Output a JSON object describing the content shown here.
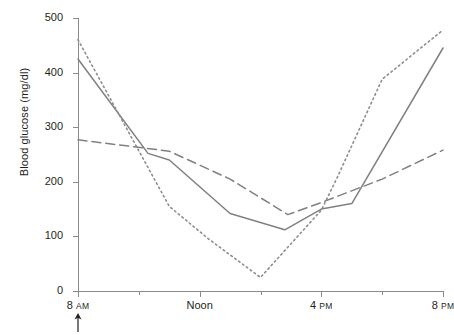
{
  "chart_data": {
    "type": "line",
    "title": "",
    "xlabel": "",
    "ylabel": "Blood glucose (mg/dl)",
    "ylim": [
      0,
      500
    ],
    "yticks": [
      0,
      100,
      200,
      300,
      400,
      500
    ],
    "ytick_labels": [
      "0",
      "100",
      "200",
      "300",
      "400",
      "500"
    ],
    "xlim": [
      "8 AM",
      "8 PM"
    ],
    "xticks_hours": [
      8,
      10,
      12,
      14,
      16,
      18,
      20
    ],
    "xtick_labels": [
      {
        "hour": 8,
        "text": "8",
        "suffix": "AM",
        "major": true
      },
      {
        "hour": 10,
        "text": "",
        "suffix": "",
        "major": false
      },
      {
        "hour": 12,
        "text": "Noon",
        "suffix": "",
        "major": true
      },
      {
        "hour": 14,
        "text": "",
        "suffix": "",
        "major": false
      },
      {
        "hour": 16,
        "text": "4",
        "suffix": "PM",
        "major": true
      },
      {
        "hour": 18,
        "text": "",
        "suffix": "",
        "major": false
      },
      {
        "hour": 20,
        "text": "8",
        "suffix": "PM",
        "major": true
      }
    ],
    "grid": false,
    "legend": "none",
    "annotations": [
      {
        "name": "dose-arrow",
        "symbol": "↑",
        "at_hour": 8,
        "below_axis": true
      }
    ],
    "series": [
      {
        "name": "solid",
        "style": "solid",
        "color": "#808080",
        "points": [
          {
            "hour": 8,
            "value": 425
          },
          {
            "hour": 10.3,
            "value": 252
          },
          {
            "hour": 11,
            "value": 240
          },
          {
            "hour": 13,
            "value": 142
          },
          {
            "hour": 14.8,
            "value": 112
          },
          {
            "hour": 16,
            "value": 150
          },
          {
            "hour": 17,
            "value": 160
          },
          {
            "hour": 20,
            "value": 445
          }
        ]
      },
      {
        "name": "dotted",
        "style": "dotted",
        "color": "#8c8c8c",
        "points": [
          {
            "hour": 8,
            "value": 460
          },
          {
            "hour": 11,
            "value": 155
          },
          {
            "hour": 12.3,
            "value": 95
          },
          {
            "hour": 14,
            "value": 25
          },
          {
            "hour": 16,
            "value": 148
          },
          {
            "hour": 16.5,
            "value": 205
          },
          {
            "hour": 18,
            "value": 388
          },
          {
            "hour": 20,
            "value": 478
          }
        ]
      },
      {
        "name": "dashed",
        "style": "dashed",
        "color": "#808080",
        "points": [
          {
            "hour": 8,
            "value": 277
          },
          {
            "hour": 11,
            "value": 256
          },
          {
            "hour": 13,
            "value": 205
          },
          {
            "hour": 14.9,
            "value": 140
          },
          {
            "hour": 16,
            "value": 162
          },
          {
            "hour": 18,
            "value": 205
          },
          {
            "hour": 20,
            "value": 258
          }
        ]
      }
    ]
  }
}
